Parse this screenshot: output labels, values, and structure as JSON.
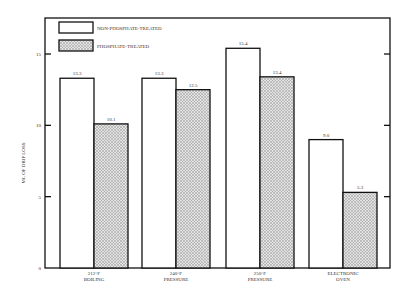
{
  "chart_data": {
    "type": "bar",
    "title": "",
    "xlabel": "",
    "ylabel": "ML OF DRIP LOSS",
    "ylim": [
      0,
      17.5
    ],
    "yticks": [
      0,
      5,
      10,
      15
    ],
    "grid": false,
    "legend_position": "top-left inside",
    "categories": [
      [
        "212°F",
        "BOILING"
      ],
      [
        "240°F",
        "PRESSURE"
      ],
      [
        "250°F",
        "PRESSURE"
      ],
      [
        "ELECTRONIC",
        "OVEN"
      ]
    ],
    "series": [
      {
        "name": "NON-PHOSPHATE-TREATED",
        "fill": "#ffffff",
        "pattern": "none",
        "values": [
          13.3,
          13.3,
          15.4,
          9.0
        ],
        "labels": [
          "13.3",
          "13.3",
          "15.4",
          "9.0"
        ]
      },
      {
        "name": "PHOSPHATE-TREATED",
        "fill": "#c8c8c8",
        "pattern": "stipple",
        "values": [
          10.1,
          12.5,
          13.4,
          5.3
        ],
        "labels": [
          "10.1",
          "12.5",
          "13.4",
          "5.3"
        ]
      }
    ]
  },
  "colors": {
    "stroke": "#111111",
    "hatch_bg": "#e6e6e6",
    "hatch_dot": "#8a8a8a"
  }
}
